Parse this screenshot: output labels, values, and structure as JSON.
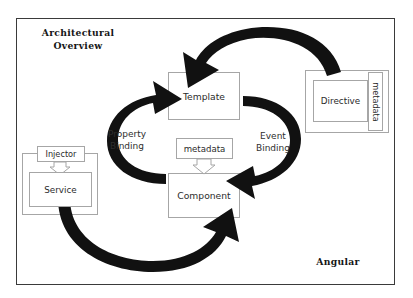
{
  "diagram": {
    "title": "Architectural Overview",
    "title_line1": "Architectural",
    "title_line2": "Overview",
    "brand": "Angular",
    "frame_border_color": "#3a3a3a",
    "background_color": "#ffffff",
    "arrow_color": "#111111",
    "box_border_color": "#a6a6a6",
    "text_color": "#2b2b2b"
  },
  "nodes": {
    "template": "Template",
    "component": "Component",
    "component_metadata": "metadata",
    "directive": "Directive",
    "directive_metadata": "metadata",
    "injector": "Injector",
    "service": "Service"
  },
  "arcs": [
    {
      "name": "property-binding",
      "label_line1": "Property",
      "label_line2": "Binding",
      "from": "Component",
      "to": "Template",
      "style": "solid-black-curved"
    },
    {
      "name": "event-binding",
      "label_line1": "Event",
      "label_line2": "Binding",
      "from": "Template",
      "to": "Component",
      "style": "solid-black-curved"
    },
    {
      "name": "directive-to-template",
      "label_line1": "",
      "label_line2": "",
      "from": "Directive",
      "to": "Template",
      "style": "solid-black-curved"
    },
    {
      "name": "service-to-component",
      "label_line1": "",
      "label_line2": "",
      "from": "Service",
      "to": "Component",
      "style": "solid-black-curved"
    }
  ],
  "hollow_arrows": [
    {
      "name": "metadata-to-component",
      "from": "metadata",
      "to": "Component",
      "direction": "down"
    },
    {
      "name": "metadata-to-directive",
      "from": "metadata",
      "to": "Directive",
      "direction": "left"
    },
    {
      "name": "injector-to-service",
      "from": "Injector",
      "to": "Service",
      "direction": "down"
    }
  ]
}
